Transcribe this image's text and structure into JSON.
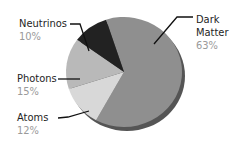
{
  "chart_data": {
    "type": "pie",
    "title": "",
    "slices": [
      {
        "label": "Dark Matter",
        "value": 63,
        "display": "63%",
        "color": "#8f8f8f"
      },
      {
        "label": "Atoms",
        "value": 12,
        "display": "12%",
        "color": "#d8d8d8"
      },
      {
        "label": "Photons",
        "value": 15,
        "display": "15%",
        "color": "#b9b9b9"
      },
      {
        "label": "Neutrinos",
        "value": 10,
        "display": "10%",
        "color": "#222222"
      }
    ],
    "categories": [
      "Dark Matter",
      "Atoms",
      "Photons",
      "Neutrinos"
    ],
    "values": [
      63,
      12,
      15,
      10
    ],
    "legend": "callout labels with leader lines",
    "style": "3D tilted pie"
  },
  "labels": {
    "neutrinos": {
      "name": "Neutrinos",
      "pct": "10%"
    },
    "photons": {
      "name": "Photons",
      "pct": "15%"
    },
    "atoms": {
      "name": "Atoms",
      "pct": "12%"
    },
    "dark_matter": {
      "name_line1": "Dark",
      "name_line2": "Matter",
      "pct": "63%"
    }
  },
  "colors": {
    "dark_matter": "#8f8f8f",
    "dark_matter_edge": "#555555",
    "atoms": "#d8d8d8",
    "photons": "#b9b9b9",
    "neutrinos": "#222222",
    "leader_line": "#111111",
    "pct_text": "#9a9a9a"
  }
}
